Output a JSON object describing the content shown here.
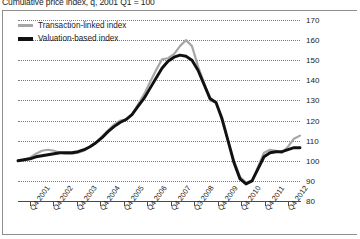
{
  "chart_title": "Cumulative price index, q, 2001 Q1 = 100",
  "legend": {
    "position": "top-left",
    "items": [
      {
        "label": "Transaction-linked index",
        "color": "#a6a6a6",
        "swatch": "gray"
      },
      {
        "label": "Valuation-based index",
        "color": "#111111",
        "swatch": "black"
      }
    ]
  },
  "axis": {
    "y_ticks": [
      170,
      160,
      150,
      140,
      130,
      120,
      110,
      100,
      90,
      80
    ],
    "x_ticks": [
      "Q4 2001",
      "Q4 2002",
      "Q4 2003",
      "Q4 2004",
      "Q4 2005",
      "Q4 2006",
      "Q4 2007",
      "Q3 2008",
      "Q4 2009",
      "Q4 2010",
      "Q4 2011",
      "Q4 2012"
    ]
  },
  "chart_data": {
    "type": "line",
    "title": "Cumulative price index, q, 2001 Q1 = 100",
    "xlabel": "",
    "ylabel": "",
    "ylim": [
      80,
      170
    ],
    "grid": true,
    "legend_position": "top-left",
    "x_tick_labels": [
      "Q4 2001",
      "Q4 2002",
      "Q4 2003",
      "Q4 2004",
      "Q4 2005",
      "Q4 2006",
      "Q4 2007",
      "Q3 2008",
      "Q4 2009",
      "Q4 2010",
      "Q4 2011",
      "Q4 2012"
    ],
    "x_quarters": [
      "2001 Q1",
      "2001 Q2",
      "2001 Q3",
      "2001 Q4",
      "2002 Q1",
      "2002 Q2",
      "2002 Q3",
      "2002 Q4",
      "2003 Q1",
      "2003 Q2",
      "2003 Q3",
      "2003 Q4",
      "2004 Q1",
      "2004 Q2",
      "2004 Q3",
      "2004 Q4",
      "2005 Q1",
      "2005 Q2",
      "2005 Q3",
      "2005 Q4",
      "2006 Q1",
      "2006 Q2",
      "2006 Q3",
      "2006 Q4",
      "2007 Q1",
      "2007 Q2",
      "2007 Q3",
      "2007 Q4",
      "2008 Q1",
      "2008 Q2",
      "2008 Q3",
      "2008 Q4",
      "2009 Q1",
      "2009 Q2",
      "2009 Q3",
      "2009 Q4",
      "2010 Q1",
      "2010 Q2",
      "2010 Q3",
      "2010 Q4",
      "2011 Q1",
      "2011 Q2",
      "2011 Q3",
      "2011 Q4",
      "2012 Q1",
      "2012 Q2",
      "2012 Q3",
      "2012 Q4"
    ],
    "series": [
      {
        "name": "Transaction-linked index",
        "color": "#a6a6a6",
        "values": [
          100,
          100.5,
          101.5,
          103.5,
          105,
          105.5,
          105,
          104,
          103.5,
          103.5,
          104,
          105,
          107,
          109,
          112,
          115,
          118,
          120,
          120.5,
          123,
          128,
          133,
          139,
          145,
          150.5,
          151,
          153,
          157,
          160,
          157,
          147,
          139,
          130,
          129,
          120,
          110,
          100,
          92,
          89,
          90,
          97,
          104,
          105.5,
          105,
          104,
          107,
          111,
          112.5
        ]
      },
      {
        "name": "Valuation-based index",
        "color": "#111111",
        "values": [
          100,
          100.5,
          101,
          102,
          102.5,
          103,
          103.5,
          104,
          104,
          104,
          104.5,
          105.5,
          107,
          109,
          111.5,
          114.5,
          117,
          119,
          120.5,
          123,
          127,
          131,
          136,
          141,
          146,
          149.5,
          151.5,
          152.5,
          152,
          150,
          145,
          138,
          131,
          129,
          121,
          110,
          99,
          91,
          88.5,
          90,
          96,
          102,
          104,
          104.5,
          104.5,
          105.5,
          106.5,
          106.5
        ]
      }
    ]
  }
}
